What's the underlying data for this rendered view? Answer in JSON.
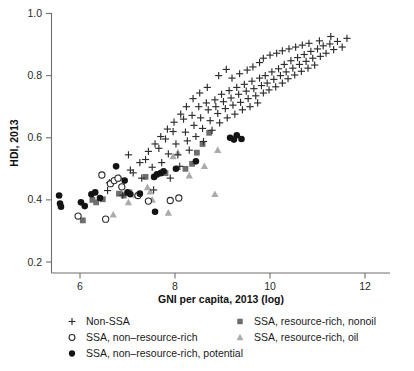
{
  "figure": {
    "background": "#ffffff",
    "width": 414,
    "height": 371
  },
  "chart_data": {
    "type": "scatter",
    "title": "",
    "xlabel": "GNI per capita, 2013 (log)",
    "ylabel": "HDI, 2013",
    "xlim": [
      5.4,
      12.2
    ],
    "ylim": [
      0.17,
      1.02
    ],
    "xticks": [
      6,
      8,
      10,
      12
    ],
    "xticklabels": [
      "6",
      "8",
      "10",
      "12"
    ],
    "yticks": [
      0.2,
      0.4,
      0.6,
      0.8,
      1.0
    ],
    "yticklabels": [
      "0.2",
      "0.4",
      "0.6",
      "0.8",
      "1.0"
    ],
    "grid": false,
    "legend_position": "below-axes",
    "colors": {
      "non_ssa": "#2d2d2d",
      "ssa_non_resource_rich": "#2b2b2b",
      "ssa_non_resource_rich_potential": "#141414",
      "ssa_resource_rich_nonoil": "#6e6e6e",
      "ssa_resource_rich_oil": "#ababab"
    },
    "series": [
      {
        "name": "Non-SSA",
        "marker": "plus",
        "color": "#2d2d2d",
        "points": [
          [
            6.62,
            0.455
          ],
          [
            6.9,
            0.415
          ],
          [
            7.02,
            0.545
          ],
          [
            7.12,
            0.487
          ],
          [
            7.3,
            0.47
          ],
          [
            7.38,
            0.53
          ],
          [
            7.52,
            0.505
          ],
          [
            7.55,
            0.432
          ],
          [
            7.66,
            0.566
          ],
          [
            7.72,
            0.52
          ],
          [
            7.8,
            0.596
          ],
          [
            7.86,
            0.548
          ],
          [
            7.9,
            0.47
          ],
          [
            7.96,
            0.62
          ],
          [
            8.02,
            0.58
          ],
          [
            8.06,
            0.545
          ],
          [
            8.1,
            0.508
          ],
          [
            8.18,
            0.66
          ],
          [
            8.22,
            0.618
          ],
          [
            8.26,
            0.59
          ],
          [
            8.3,
            0.56
          ],
          [
            8.36,
            0.672
          ],
          [
            8.4,
            0.64
          ],
          [
            8.44,
            0.604
          ],
          [
            8.5,
            0.7
          ],
          [
            8.54,
            0.664
          ],
          [
            8.58,
            0.63
          ],
          [
            8.6,
            0.588
          ],
          [
            8.66,
            0.712
          ],
          [
            8.7,
            0.69
          ],
          [
            8.74,
            0.655
          ],
          [
            8.78,
            0.624
          ],
          [
            8.84,
            0.722
          ],
          [
            8.86,
            0.7
          ],
          [
            8.9,
            0.678
          ],
          [
            8.94,
            0.648
          ],
          [
            8.98,
            0.74
          ],
          [
            9.02,
            0.716
          ],
          [
            9.06,
            0.694
          ],
          [
            9.1,
            0.664
          ],
          [
            9.14,
            0.752
          ],
          [
            9.18,
            0.728
          ],
          [
            9.22,
            0.705
          ],
          [
            9.26,
            0.676
          ],
          [
            9.3,
            0.762
          ],
          [
            9.34,
            0.74
          ],
          [
            9.38,
            0.714
          ],
          [
            9.42,
            0.69
          ],
          [
            9.46,
            0.772
          ],
          [
            9.5,
            0.75
          ],
          [
            9.54,
            0.726
          ],
          [
            9.58,
            0.7
          ],
          [
            9.62,
            0.782
          ],
          [
            9.66,
            0.758
          ],
          [
            9.7,
            0.735
          ],
          [
            9.74,
            0.712
          ],
          [
            9.78,
            0.792
          ],
          [
            9.82,
            0.768
          ],
          [
            9.86,
            0.744
          ],
          [
            9.9,
            0.8
          ],
          [
            9.94,
            0.776
          ],
          [
            9.98,
            0.754
          ],
          [
            10.04,
            0.812
          ],
          [
            10.08,
            0.788
          ],
          [
            10.12,
            0.764
          ],
          [
            10.18,
            0.822
          ],
          [
            10.22,
            0.8
          ],
          [
            10.26,
            0.776
          ],
          [
            10.3,
            0.836
          ],
          [
            10.34,
            0.812
          ],
          [
            10.38,
            0.79
          ],
          [
            10.44,
            0.848
          ],
          [
            10.48,
            0.824
          ],
          [
            10.52,
            0.802
          ],
          [
            10.58,
            0.858
          ],
          [
            10.62,
            0.836
          ],
          [
            10.66,
            0.814
          ],
          [
            10.72,
            0.868
          ],
          [
            10.76,
            0.846
          ],
          [
            10.8,
            0.824
          ],
          [
            10.86,
            0.878
          ],
          [
            10.9,
            0.856
          ],
          [
            10.94,
            0.834
          ],
          [
            11.0,
            0.886
          ],
          [
            11.06,
            0.862
          ],
          [
            11.12,
            0.896
          ],
          [
            11.18,
            0.872
          ],
          [
            11.26,
            0.902
          ],
          [
            11.34,
            0.884
          ],
          [
            11.42,
            0.91
          ],
          [
            11.52,
            0.892
          ],
          [
            11.62,
            0.92
          ],
          [
            8.92,
            0.8
          ],
          [
            9.08,
            0.82
          ],
          [
            9.2,
            0.792
          ],
          [
            9.36,
            0.806
          ],
          [
            9.52,
            0.818
          ],
          [
            9.64,
            0.828
          ],
          [
            9.78,
            0.842
          ],
          [
            9.86,
            0.856
          ],
          [
            10.0,
            0.866
          ],
          [
            10.14,
            0.872
          ],
          [
            10.26,
            0.88
          ],
          [
            10.4,
            0.886
          ],
          [
            10.54,
            0.892
          ],
          [
            10.68,
            0.898
          ],
          [
            10.82,
            0.904
          ],
          [
            11.04,
            0.912
          ],
          [
            11.28,
            0.926
          ],
          [
            8.68,
            0.762
          ],
          [
            8.52,
            0.744
          ],
          [
            8.38,
            0.726
          ],
          [
            8.24,
            0.7
          ],
          [
            8.12,
            0.676
          ],
          [
            7.98,
            0.65
          ],
          [
            7.84,
            0.628
          ],
          [
            7.7,
            0.604
          ],
          [
            7.58,
            0.58
          ],
          [
            7.44,
            0.556
          ],
          [
            7.26,
            0.52
          ],
          [
            7.06,
            0.496
          ],
          [
            6.82,
            0.47
          ],
          [
            6.58,
            0.43
          ]
        ]
      },
      {
        "name": "SSA, non–resource-rich",
        "marker": "open-circle",
        "color": "#2b2b2b",
        "points": [
          [
            5.96,
            0.348
          ],
          [
            6.46,
            0.48
          ],
          [
            6.64,
            0.452
          ],
          [
            6.72,
            0.462
          ],
          [
            6.8,
            0.47
          ],
          [
            6.88,
            0.442
          ],
          [
            7.22,
            0.414
          ],
          [
            7.44,
            0.396
          ],
          [
            6.54,
            0.338
          ],
          [
            7.9,
            0.398
          ],
          [
            8.08,
            0.406
          ]
        ]
      },
      {
        "name": "SSA, non–resource-rich, potential",
        "marker": "filled-circle",
        "color": "#141414",
        "points": [
          [
            5.56,
            0.414
          ],
          [
            5.58,
            0.388
          ],
          [
            5.6,
            0.378
          ],
          [
            6.02,
            0.392
          ],
          [
            6.1,
            0.38
          ],
          [
            6.24,
            0.418
          ],
          [
            6.32,
            0.424
          ],
          [
            6.42,
            0.406
          ],
          [
            6.76,
            0.508
          ],
          [
            6.94,
            0.462
          ],
          [
            7.0,
            0.424
          ],
          [
            7.06,
            0.418
          ],
          [
            7.26,
            0.42
          ],
          [
            7.56,
            0.474
          ],
          [
            7.62,
            0.482
          ],
          [
            7.7,
            0.486
          ],
          [
            7.76,
            0.492
          ],
          [
            7.58,
            0.362
          ],
          [
            8.44,
            0.524
          ],
          [
            9.16,
            0.6
          ],
          [
            9.24,
            0.594
          ],
          [
            9.3,
            0.608
          ],
          [
            9.4,
            0.596
          ],
          [
            8.02,
            0.5
          ]
        ]
      },
      {
        "name": "SSA, resource-rich, nonoil",
        "marker": "square",
        "color": "#6e6e6e",
        "points": [
          [
            6.06,
            0.334
          ],
          [
            6.26,
            0.4
          ],
          [
            6.34,
            0.392
          ],
          [
            6.48,
            0.402
          ],
          [
            6.82,
            0.42
          ],
          [
            6.92,
            0.414
          ],
          [
            7.04,
            0.424
          ],
          [
            7.38,
            0.474
          ],
          [
            7.8,
            0.486
          ],
          [
            8.22,
            0.5
          ],
          [
            8.46,
            0.552
          ],
          [
            8.58,
            0.58
          ],
          [
            8.36,
            0.516
          ],
          [
            8.72,
            0.616
          ]
        ]
      },
      {
        "name": "SSA, resource-rich, oil",
        "marker": "triangle",
        "color": "#ababab",
        "points": [
          [
            6.7,
            0.352
          ],
          [
            7.02,
            0.392
          ],
          [
            7.18,
            0.414
          ],
          [
            7.42,
            0.44
          ],
          [
            7.48,
            0.426
          ],
          [
            7.52,
            0.4
          ],
          [
            7.86,
            0.358
          ],
          [
            8.3,
            0.478
          ],
          [
            8.62,
            0.508
          ],
          [
            8.84,
            0.418
          ],
          [
            8.9,
            0.56
          ],
          [
            7.96,
            0.54
          ],
          [
            8.06,
            0.552
          ]
        ]
      }
    ]
  },
  "legend": {
    "entries": [
      {
        "marker": "plus",
        "label": "Non-SSA"
      },
      {
        "marker": "open-circle",
        "label": "SSA, non–resource-rich"
      },
      {
        "marker": "filled-circle",
        "label": "SSA, non–resource-rich, potential"
      },
      {
        "marker": "square",
        "label": "SSA, resource-rich, nonoil"
      },
      {
        "marker": "triangle",
        "label": "SSA, resource-rich, oil"
      }
    ]
  }
}
